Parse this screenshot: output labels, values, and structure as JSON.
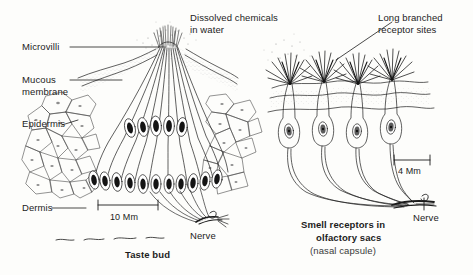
{
  "figure": {
    "background_color": "#fdfdfb",
    "ink_color": "#1c1c1c"
  },
  "labels": {
    "microvilli": "Microvilli",
    "mucous_membrane_line1": "Mucous",
    "mucous_membrane_line2": "membrane",
    "epidermis": "Epidermis",
    "dermis": "Dermis",
    "dissolved_line1": "Dissolved chemicals",
    "dissolved_line2": "in water",
    "long_branched_line1": "Long branched",
    "long_branched_line2": "receptor sites",
    "nerve_left": "Nerve",
    "nerve_right": "Nerve"
  },
  "scale_bars": {
    "left": {
      "value": "10 Mm",
      "length_px": 60
    },
    "right": {
      "value": "4 Mm",
      "length_px": 36
    }
  },
  "captions": {
    "left": {
      "title": "Taste bud"
    },
    "right": {
      "title_line1": "Smell receptors in",
      "title_line2": "olfactory sacs",
      "subtitle": "(nasal capsule)"
    }
  },
  "left_panel": {
    "name": "taste-bud-diagram",
    "structures": [
      "taste pore",
      "microvilli tuft",
      "mucous membrane",
      "epidermis polygonal cells",
      "gustatory receptor cells",
      "basal cells",
      "nerve fibre bundle",
      "dermis boundary"
    ],
    "receptor_cell_count": 11,
    "basal_cell_count": 13
  },
  "right_panel": {
    "name": "olfactory-receptors-diagram",
    "structures": [
      "branched receptor cilia",
      "olfactory epithelium surface",
      "olfactory receptor cell bodies",
      "axons",
      "nerve bundle"
    ],
    "receptor_cell_count": 4
  }
}
